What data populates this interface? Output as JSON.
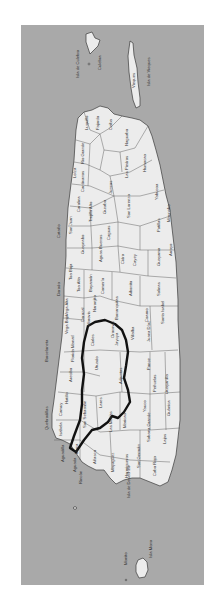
{
  "map": {
    "title": "Puerto Rico municipalities",
    "orientation": "rotated 90° (north to the left)",
    "colors": {
      "sea": "#a9a9a9",
      "land": "#ececec",
      "border": "#3a3a3a",
      "highlight": "#111111"
    },
    "islands": [
      {
        "name": "Isla de Culebra",
        "label": "Isla de Culebra"
      },
      {
        "name": "Culebra",
        "label": "Culebra"
      },
      {
        "name": "Isla de Vieques",
        "label": "Isla de Vieques"
      },
      {
        "name": "Vieques",
        "label": "Vieques"
      },
      {
        "name": "Isla Mona",
        "label": "Isla Mona"
      },
      {
        "name": "Monito",
        "label": "Monito"
      },
      {
        "name": "Desecheo",
        "label": "Isla de Desecheo"
      }
    ],
    "municipalities": [
      "Fajardo",
      "Luquillo",
      "Ceiba",
      "Rio Grande",
      "Naguabo",
      "Canóvanas",
      "Loíza",
      "Las Piedras",
      "Humacao",
      "Carolina",
      "Juncos",
      "Yabucoa",
      "Trujillo Alto",
      "San Lorenzo",
      "Maunabo",
      "Gurabo",
      "Patillas",
      "San Juan",
      "Caguas",
      "Arroyo",
      "Guaynabo",
      "Cataño",
      "Bayamón",
      "Aguas Buenas",
      "Cidra",
      "Cayey",
      "Guayama",
      "Toa Baja",
      "Toa Alta",
      "Comerío",
      "Aibonito",
      "Salinas",
      "Dorado",
      "Naranjito",
      "Barranquitas",
      "Coamo",
      "Santa Isabel",
      "Vega Alta",
      "Corozal",
      "Orocovis",
      "Villalba",
      "Juana Díaz",
      "Vega Baja",
      "Morovis",
      "Manatí",
      "Ciales",
      "Barceloneta",
      "Florida",
      "Arecibo",
      "Utuado",
      "Jayuya",
      "Ponce",
      "Adjuntas",
      "Peñuelas",
      "Guayanilla",
      "Hatillo",
      "Camuy",
      "Quebradillas",
      "Lares",
      "Yauco",
      "Guánica",
      "Isabela",
      "San Sebastián",
      "Las Marías",
      "Maricao",
      "Sabana Grande",
      "Lajas",
      "Moca",
      "Aguadilla",
      "Aguada",
      "Rincón",
      "Añasco",
      "Mayagüez",
      "Hormigueros",
      "San Germán",
      "Cabo Rojo"
    ],
    "highlighted_region": {
      "label": "outlined region",
      "includes": [
        "Jayuya",
        "Utuado",
        "Adjuntas",
        "Lares",
        "Maricao",
        "Las Marías",
        "San Sebastián",
        "Moca",
        "Isabela"
      ]
    },
    "labels": {
      "culebra_island": "Isla de Culebra",
      "culebra": "Culebra",
      "vieques_island": "Isla de Vieques",
      "vieques": "Vieques",
      "fajardo": "Fajardo",
      "luquillo": "Luquillo",
      "ceiba": "Ceiba",
      "rio_grande": "Rio Grande",
      "naguabo": "Naguabo",
      "canovanas": "Canóvanas",
      "loiza": "Loíza",
      "las_piedras": "Las Piedras",
      "humacao": "Humacao",
      "carolina": "Carolina",
      "juncos": "Juncos",
      "yabucoa": "Yabucoa",
      "trujillo_alto": "Trujillo Alto",
      "san_lorenzo": "San Lorenzo",
      "maunabo": "Maunabo",
      "gurabo": "Gurabo",
      "patillas": "Patillas",
      "san_juan": "San Juan",
      "caguas": "Caguas",
      "arroyo": "Arroyo",
      "guaynabo": "Guaynabo",
      "catano": "Cataño",
      "bayamon": "Bayamón",
      "aguas_buenas": "Aguas Buenas",
      "cidra": "Cidra",
      "cayey": "Cayey",
      "guayama": "Guayama",
      "toa_baja": "Toa Baja",
      "toa_alta": "Toa Alta",
      "comerio": "Comerío",
      "aibonito": "Aibonito",
      "salinas": "Salinas",
      "dorado": "Dorado",
      "naranjito": "Naranjito",
      "barranquitas": "Barranquitas",
      "coamo": "Coamo",
      "santa_isabel": "Santa Isabel",
      "vega_alta": "Vega Alta",
      "corozal": "Corozal",
      "orocovis": "Orocovis",
      "villalba": "Villalba",
      "juana_diaz": "Juana Díaz",
      "vega_baja": "Vega Baja",
      "morovis": "Morovis",
      "manati": "Manatí",
      "ciales": "Ciales",
      "barceloneta": "Barceloneta",
      "florida": "Florida",
      "arecibo": "Arecibo",
      "utuado": "Utuado",
      "jayuya": "Jayuya",
      "ponce": "Ponce",
      "adjuntas": "Adjuntas",
      "penuelas": "Peñuelas",
      "guayanilla": "Guayanilla",
      "hatillo": "Hatillo",
      "camuy": "Camuy",
      "quebradillas": "Quebradillas",
      "lares": "Lares",
      "yauco": "Yauco",
      "guanica": "Guánica",
      "isabela": "Isabela",
      "san_sebastian": "San Sebastián",
      "las_marias": "Las Marías",
      "maricao": "Maricao",
      "sabana_grande": "Sabana Grande",
      "lajas": "Lajas",
      "moca": "Moca",
      "aguadilla": "Aguadilla",
      "aguada": "Aguada",
      "rincon": "Rincón",
      "anasco": "Añasco",
      "mayaguez": "Mayagüez",
      "hormigueros": "Hormigueros",
      "san_german": "San Germán",
      "cabo_rojo": "Cabo Rojo",
      "desecheo": "Isla de Desecheo",
      "mona_island": "Isla Mona",
      "monito": "Monito"
    }
  }
}
